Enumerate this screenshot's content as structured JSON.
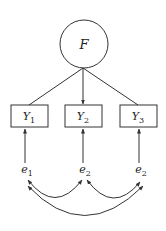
{
  "diagram": {
    "type": "sem-path-diagram",
    "factor": {
      "label": "F",
      "shape": "circle"
    },
    "indicators": [
      {
        "label": "Y",
        "subscript": "1"
      },
      {
        "label": "Y",
        "subscript": "2"
      },
      {
        "label": "Y",
        "subscript": "3"
      }
    ],
    "errors": [
      {
        "label": "e",
        "subscript": "1"
      },
      {
        "label": "e",
        "subscript": "2"
      },
      {
        "label": "e",
        "subscript": "2"
      }
    ],
    "paths": [
      {
        "from": "F",
        "to": "Y1",
        "arrow": false
      },
      {
        "from": "F",
        "to": "Y2",
        "arrow": true
      },
      {
        "from": "F",
        "to": "Y3",
        "arrow": false
      },
      {
        "from": "e1",
        "to": "Y1",
        "arrow": true
      },
      {
        "from": "e2",
        "to": "Y2",
        "arrow": true
      },
      {
        "from": "e3",
        "to": "Y3",
        "arrow": true
      }
    ],
    "covariances": [
      {
        "between": [
          "e1",
          "e2"
        ],
        "double_headed": true
      },
      {
        "between": [
          "e2",
          "e3"
        ],
        "double_headed": true
      },
      {
        "between": [
          "e1",
          "e3"
        ],
        "double_headed": true
      }
    ],
    "colors": {
      "stroke": "#333333",
      "background": "#ffffff"
    }
  }
}
